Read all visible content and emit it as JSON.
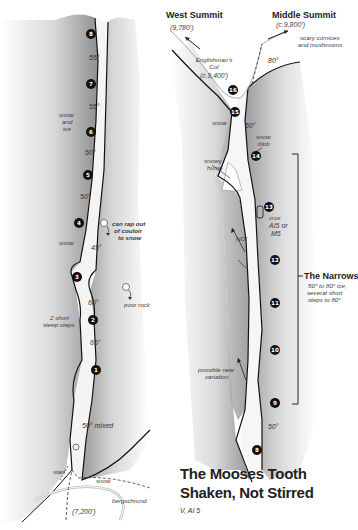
{
  "title": {
    "peak": "The Mooses Tooth",
    "route": "Shaken, Not Stirred",
    "grade": "V, AI 5"
  },
  "summits": {
    "west": {
      "name": "West Summit",
      "elevation": "(9,780')"
    },
    "middle": {
      "name": "Middle Summit",
      "elevation": "(c.9,800')"
    }
  },
  "col": {
    "line1": "Englishman's",
    "line2": "Col",
    "line3": "(c.9,400')"
  },
  "narrows": {
    "title": "The Narrows",
    "line1": "50° to 80° ice,",
    "line2": "several short",
    "line3": "steps to 80°"
  },
  "left_column": {
    "pitches": [
      "8",
      "7",
      "6",
      "5",
      "4",
      "3",
      "2",
      "1"
    ],
    "grades": [
      "55°",
      "55°",
      "50°",
      "50°",
      "45°",
      "60°",
      "65°",
      "50° mixed"
    ],
    "labels": {
      "snow_and_ice": [
        "snow",
        "and",
        "ice"
      ],
      "snow": "snow",
      "rap": [
        "can rap out",
        "of couloir",
        "to snow"
      ],
      "poor_rock": "poor rock",
      "steep_steps": [
        "2 short",
        "steep steps"
      ],
      "start": "start",
      "snow_bottom": "snow",
      "bergschrund": "bergschrund",
      "base_elev": "(7,200')"
    }
  },
  "right_column": {
    "pitches": [
      "16",
      "15",
      "14",
      "13",
      "12",
      "11",
      "10",
      "9",
      "8"
    ],
    "grades": [
      "80°",
      "50°",
      "50°"
    ],
    "labels": {
      "cornices": [
        "scary cornices",
        "and mushrooms"
      ],
      "snow": "snow",
      "snow_blob": [
        "snow",
        "blob"
      ],
      "snowy_hump": [
        "snowy",
        "hump"
      ],
      "crux": [
        "crux",
        "AI5 or",
        "M5"
      ],
      "no": "NO!",
      "variation": [
        "possible new",
        "variation"
      ]
    }
  }
}
